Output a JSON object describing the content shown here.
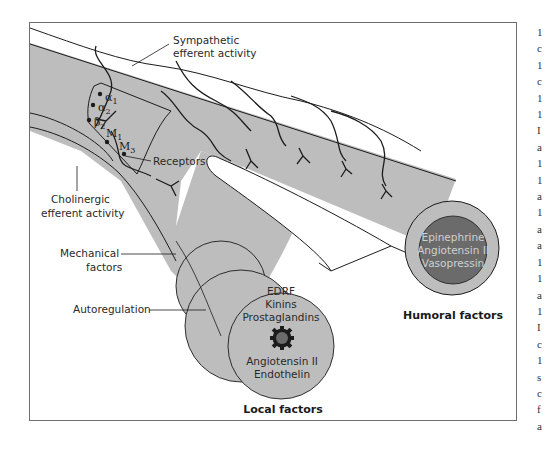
{
  "diagram": {
    "labels": {
      "sympathetic": [
        "Sympathetic",
        "efferent activity"
      ],
      "cholinergic": [
        "Cholinergic",
        "efferent activity"
      ],
      "receptors": "Receptors",
      "mechanical": [
        "Mechanical",
        "factors"
      ],
      "autoregulation": "Autoregulation",
      "local_title": "Local factors",
      "humoral_title": "Humoral factors"
    },
    "receptor_types": [
      {
        "symbol": "α",
        "sub": "1"
      },
      {
        "symbol": "α",
        "sub": "2"
      },
      {
        "symbol": "β",
        "sub": "2"
      },
      {
        "symbol": "M",
        "sub": "1"
      },
      {
        "symbol": "M",
        "sub": "3"
      }
    ],
    "local_factors": {
      "top": [
        "EDRF",
        "Kinins",
        "Prostaglandins"
      ],
      "bottom": [
        "Angiotensin II",
        "Endothelin"
      ],
      "icon": "endothelial-cell-gear-icon"
    },
    "humoral_factors": [
      "Epinephrine",
      "Angiotensin II",
      "Vasopressin"
    ],
    "colors": {
      "vessel": "#bdbdbd",
      "lumen_dark": "#6b6b6b",
      "outline": "#1c1c1c",
      "frame": "#6e6e6e"
    }
  },
  "side_text_fragments": [
    "1",
    "c",
    "1",
    "c",
    "1",
    "1",
    "I",
    "a",
    "1",
    "1",
    "a",
    "1",
    "a",
    "a",
    "1",
    "1",
    "a",
    "1",
    "I",
    "c",
    "1",
    "s",
    "c",
    "f",
    "a"
  ]
}
